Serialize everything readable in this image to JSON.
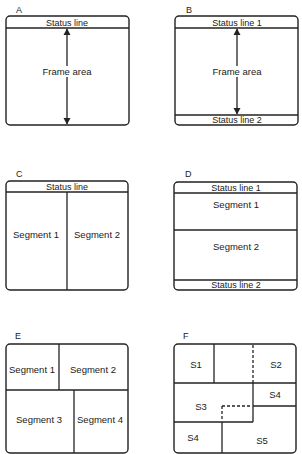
{
  "panels": {
    "A": {
      "label": "A",
      "status_line": "Status line",
      "frame_area": "Frame area"
    },
    "B": {
      "label": "B",
      "status_line_1": "Status line 1",
      "frame_area": "Frame area",
      "status_line_2": "Status line 2"
    },
    "C": {
      "label": "C",
      "status_line": "Status line",
      "segments": [
        "Segment 1",
        "Segment 2"
      ]
    },
    "D": {
      "label": "D",
      "status_line_1": "Status line 1",
      "segments": [
        "Segment 1",
        "Segment 2"
      ],
      "status_line_2": "Status line 2"
    },
    "E": {
      "label": "E",
      "segments": [
        "Segment 1",
        "Segment 2",
        "Segment 3",
        "Segment 4"
      ]
    },
    "F": {
      "label": "F",
      "segments": [
        "S1",
        "S2",
        "S3",
        "S4",
        "S4",
        "S5"
      ]
    }
  }
}
